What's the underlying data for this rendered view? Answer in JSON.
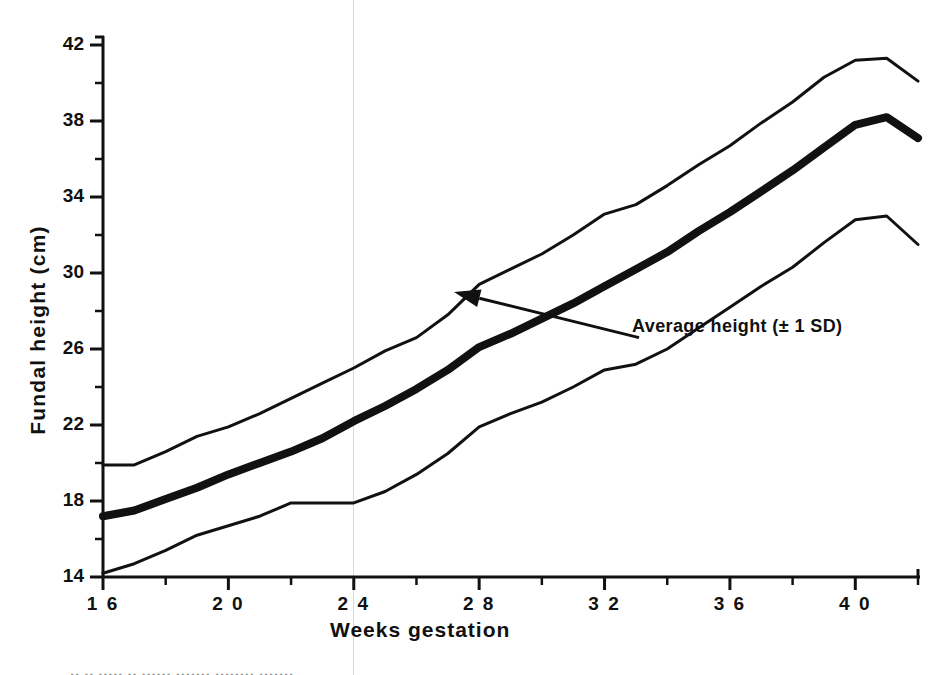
{
  "chart_data": {
    "type": "line",
    "title": "",
    "xlabel": "Weeks  gestation",
    "ylabel": "Fundal  height  (cm)",
    "xlim": [
      16,
      42
    ],
    "ylim": [
      14,
      42
    ],
    "xticks": [
      16,
      18,
      20,
      22,
      24,
      26,
      28,
      30,
      32,
      34,
      36,
      38,
      40,
      42
    ],
    "xtick_labels": [
      "1 6",
      "",
      "2 0",
      "",
      "2 4",
      "",
      "2 8",
      "",
      "3 2",
      "",
      "3 6",
      "",
      "4 0",
      ""
    ],
    "yticks": [
      14,
      16,
      18,
      20,
      22,
      24,
      26,
      28,
      30,
      32,
      34,
      36,
      38,
      40,
      42
    ],
    "ytick_labels": [
      "14",
      "",
      "18",
      "",
      "22",
      "",
      "26",
      "",
      "30",
      "",
      "34",
      "",
      "38",
      "",
      "42"
    ],
    "grid": false,
    "legend": "none",
    "annotations": [
      {
        "text": "Average height (± 1 SD)",
        "target_x": 27.2,
        "target_y": 29.0,
        "label_x": 33.1,
        "label_y": 26.6
      }
    ],
    "x": [
      16,
      17,
      18,
      19,
      20,
      21,
      22,
      23,
      24,
      25,
      26,
      27,
      28,
      29,
      30,
      31,
      32,
      33,
      34,
      35,
      36,
      37,
      38,
      39,
      40,
      41,
      42
    ],
    "series": [
      {
        "name": "+1 SD",
        "line_width_px": 3,
        "values": [
          19.9,
          19.9,
          20.6,
          21.4,
          21.9,
          22.6,
          23.4,
          24.2,
          25.0,
          25.9,
          26.6,
          27.8,
          29.4,
          30.2,
          31.0,
          32.0,
          33.1,
          33.6,
          34.6,
          35.7,
          36.7,
          37.9,
          39.0,
          40.3,
          41.2,
          41.3,
          40.1
        ]
      },
      {
        "name": "Average height",
        "line_width_px": 8,
        "values": [
          17.2,
          17.5,
          18.1,
          18.7,
          19.4,
          20.0,
          20.6,
          21.3,
          22.2,
          23.0,
          23.9,
          24.9,
          26.1,
          26.8,
          27.6,
          28.4,
          29.3,
          30.2,
          31.1,
          32.2,
          33.2,
          34.3,
          35.4,
          36.6,
          37.8,
          38.2,
          37.1
        ]
      },
      {
        "name": "-1 SD",
        "line_width_px": 3,
        "values": [
          14.2,
          14.7,
          15.4,
          16.2,
          16.7,
          17.2,
          17.9,
          17.9,
          17.9,
          18.5,
          19.4,
          20.5,
          21.9,
          22.6,
          23.2,
          24.0,
          24.9,
          25.2,
          26.0,
          27.1,
          28.2,
          29.3,
          30.3,
          31.6,
          32.8,
          33.0,
          31.5
        ]
      }
    ]
  },
  "caption": {
    "text": "·· ·· ····· ·· ······ ······· ········ ·······"
  }
}
